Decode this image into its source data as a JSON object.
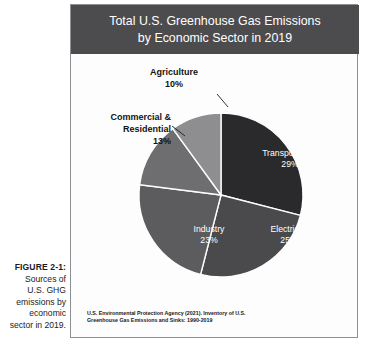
{
  "caption": {
    "figure_number": "FIGURE 2-1:",
    "lines": [
      "Sources of",
      "U.S. GHG",
      "emissions by",
      "economic",
      "sector in 2019."
    ]
  },
  "panel": {
    "title_lines": [
      "Total U.S. Greenhouse Gas Emissions",
      "by Economic Sector in 2019"
    ],
    "title_bar_color": "#4c4c4e",
    "source_lines": [
      "U.S. Environmental Protection Agency (2021). Inventory of U.S.",
      "Greenhouse Gas Emissions and Sinks: 1990-2019"
    ]
  },
  "chart_data": {
    "type": "pie",
    "title": "Total U.S. Greenhouse Gas Emissions by Economic Sector in 2019",
    "categories": [
      "Transportation",
      "Electricity",
      "Industry",
      "Commercial & Residential",
      "Agriculture"
    ],
    "values": [
      29,
      25,
      23,
      13,
      10
    ],
    "value_unit": "%",
    "slices": [
      {
        "label": "Transportation",
        "value": 29,
        "value_text": "29%",
        "color": "#2a2a2c",
        "label_position": "inside",
        "label_color": "#ffffff"
      },
      {
        "label": "Electricity",
        "value": 25,
        "value_text": "25%",
        "color": "#4a4a4c",
        "label_position": "inside",
        "label_color": "#ffffff"
      },
      {
        "label": "Industry",
        "value": 23,
        "value_text": "23%",
        "color": "#5c5c5e",
        "label_position": "inside",
        "label_color": "#ffffff"
      },
      {
        "label": "Commercial & Residential",
        "value": 13,
        "value_text": "13%",
        "color": "#6e6e70",
        "label_position": "outside",
        "label_color": "#131313"
      },
      {
        "label": "Agriculture",
        "value": 10,
        "value_text": "10%",
        "color": "#8e8e90",
        "label_position": "outside",
        "label_color": "#131313"
      }
    ],
    "start_angle_deg": 0,
    "direction": "clockwise",
    "legend": "none",
    "grid": false,
    "labels": {
      "transportation": {
        "name": "Transportation",
        "pct": "29%"
      },
      "electricity": {
        "name": "Electricity",
        "pct": "25%"
      },
      "industry": {
        "name": "Industry",
        "pct": "23%"
      },
      "commercial_residential": {
        "line1": "Commercial &",
        "line2": "Residential",
        "pct": "13%"
      },
      "agriculture": {
        "name": "Agriculture",
        "pct": "10%"
      }
    }
  }
}
